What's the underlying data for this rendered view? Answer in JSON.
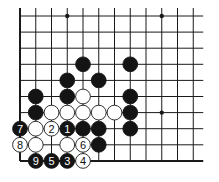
{
  "diagram": {
    "type": "go-board-diagram",
    "grid": {
      "columns": 12,
      "rows": 10,
      "origin_x": 20,
      "origin_y": 16,
      "spacing_x": 15.75,
      "spacing_y": 16.1,
      "left_edge": true,
      "bottom_edge": true,
      "top_edge": false,
      "right_edge": false
    },
    "colors": {
      "line": "#1a1a1a",
      "black_stone": "#141414",
      "white_stone": "#ffffff",
      "background": "#ffffff"
    },
    "star_points": [
      {
        "col": 3,
        "row": 0
      },
      {
        "col": 9,
        "row": 0
      },
      {
        "col": 9,
        "row": 6
      }
    ],
    "stones": [
      {
        "col": 4,
        "row": 3,
        "color": "black",
        "label": ""
      },
      {
        "col": 7,
        "row": 3,
        "color": "black",
        "label": ""
      },
      {
        "col": 3,
        "row": 4,
        "color": "black",
        "label": ""
      },
      {
        "col": 5,
        "row": 4,
        "color": "black",
        "label": ""
      },
      {
        "col": 1,
        "row": 5,
        "color": "black",
        "label": ""
      },
      {
        "col": 3,
        "row": 5,
        "color": "black",
        "label": ""
      },
      {
        "col": 4,
        "row": 5,
        "color": "white",
        "label": ""
      },
      {
        "col": 7,
        "row": 5,
        "color": "black",
        "label": ""
      },
      {
        "col": 1,
        "row": 6,
        "color": "black",
        "label": ""
      },
      {
        "col": 2,
        "row": 6,
        "color": "white",
        "label": ""
      },
      {
        "col": 3,
        "row": 6,
        "color": "white",
        "label": ""
      },
      {
        "col": 4,
        "row": 6,
        "color": "white",
        "label": ""
      },
      {
        "col": 5,
        "row": 6,
        "color": "white",
        "label": ""
      },
      {
        "col": 6,
        "row": 6,
        "color": "white",
        "label": ""
      },
      {
        "col": 7,
        "row": 6,
        "color": "black",
        "label": ""
      },
      {
        "col": 0,
        "row": 7,
        "color": "black",
        "label": "7"
      },
      {
        "col": 1,
        "row": 7,
        "color": "white",
        "label": ""
      },
      {
        "col": 2,
        "row": 7,
        "color": "white",
        "label": "2"
      },
      {
        "col": 3,
        "row": 7,
        "color": "black",
        "label": "1"
      },
      {
        "col": 4,
        "row": 7,
        "color": "black",
        "label": ""
      },
      {
        "col": 5,
        "row": 7,
        "color": "black",
        "label": ""
      },
      {
        "col": 7,
        "row": 7,
        "color": "black",
        "label": ""
      },
      {
        "col": 0,
        "row": 8,
        "color": "white",
        "label": "8"
      },
      {
        "col": 1,
        "row": 8,
        "color": "white",
        "label": ""
      },
      {
        "col": 3,
        "row": 8,
        "color": "white",
        "label": ""
      },
      {
        "col": 4,
        "row": 8,
        "color": "white",
        "label": "6"
      },
      {
        "col": 5,
        "row": 8,
        "color": "black",
        "label": ""
      },
      {
        "col": 1,
        "row": 9,
        "color": "black",
        "label": "9"
      },
      {
        "col": 2,
        "row": 9,
        "color": "black",
        "label": "5"
      },
      {
        "col": 3,
        "row": 9,
        "color": "black",
        "label": "3"
      },
      {
        "col": 4,
        "row": 9,
        "color": "white",
        "label": "4"
      }
    ]
  }
}
